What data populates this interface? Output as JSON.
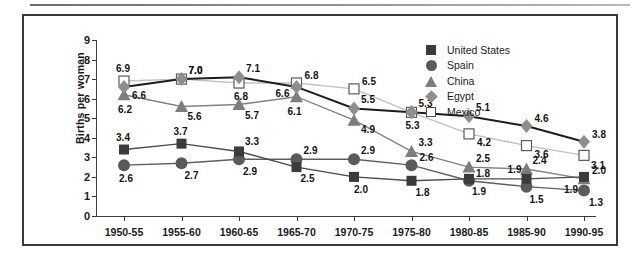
{
  "chart_data": {
    "type": "line",
    "title": "",
    "xlabel": "",
    "ylabel": "Births per woman",
    "ylim": [
      0,
      9
    ],
    "yticks": [
      0,
      1,
      2,
      3,
      4,
      5,
      6,
      7,
      8,
      9
    ],
    "grid": false,
    "legend_position": "top-right",
    "categories": [
      "1950-55",
      "1955-60",
      "1960-65",
      "1965-70",
      "1970-75",
      "1975-80",
      "1980-85",
      "1985-90",
      "1990-95"
    ],
    "series": [
      {
        "name": "United States",
        "marker": "square-filled",
        "color": "#3b3b3b",
        "line_color": "#4a4a4a",
        "values": [
          3.4,
          3.7,
          3.3,
          2.5,
          2.0,
          1.8,
          1.9,
          1.9,
          2.0
        ],
        "labels": [
          "3.4",
          "3.7",
          "3.3",
          "2.5",
          "2.0",
          "1.8",
          "1.9",
          "1.9",
          "2.0"
        ]
      },
      {
        "name": "Spain",
        "marker": "circle-filled",
        "color": "#5a5a5a",
        "line_color": "#5f5f5f",
        "values": [
          2.6,
          2.7,
          2.9,
          2.9,
          2.9,
          2.6,
          1.8,
          1.5,
          1.3
        ],
        "labels": [
          "2.6",
          "2.7",
          "2.9",
          "2.9",
          "2.9",
          "2.6",
          "1.8",
          "1.5",
          "1.3"
        ]
      },
      {
        "name": "China",
        "marker": "triangle-filled",
        "color": "#7d7d7d",
        "line_color": "#828282",
        "values": [
          6.2,
          5.6,
          5.7,
          6.1,
          4.9,
          3.3,
          2.5,
          2.4,
          1.9
        ],
        "labels": [
          "6.2",
          "5.6",
          "5.7",
          "6.1",
          "4.9",
          "3.3",
          "2.5",
          "2.4",
          "1.9"
        ]
      },
      {
        "name": "Egypt",
        "marker": "diamond-filled",
        "color": "#8e8e8e",
        "line_color": "#1c1c1c",
        "values": [
          6.6,
          7.0,
          7.1,
          6.6,
          5.5,
          5.3,
          5.1,
          4.6,
          3.8
        ],
        "labels": [
          "6.6",
          "7.0",
          "7.1",
          "6.6",
          "5.5",
          "5.3",
          "5.1",
          "4.6",
          "3.8"
        ]
      },
      {
        "name": "Mexico",
        "marker": "square-open",
        "color": "#ffffff",
        "line_color": "#c0c0c0",
        "values": [
          6.9,
          7.0,
          6.8,
          6.8,
          6.5,
          5.3,
          4.2,
          3.6,
          3.1
        ],
        "labels": [
          "6.9",
          "7.0",
          "6.8",
          "6.8",
          "6.5",
          "5.3",
          "4.2",
          "3.6",
          "3.1"
        ]
      }
    ]
  },
  "legend": {
    "items": [
      {
        "label": "United States",
        "marker": "square-filled"
      },
      {
        "label": "Spain",
        "marker": "circle-filled"
      },
      {
        "label": "China",
        "marker": "triangle-filled"
      },
      {
        "label": "Egypt",
        "marker": "diamond-filled"
      },
      {
        "label": "Mexico",
        "marker": "square-open"
      }
    ]
  }
}
